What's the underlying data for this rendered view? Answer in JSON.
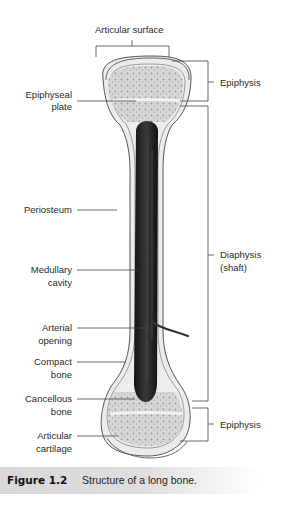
{
  "figure": {
    "number": "Figure 1.2",
    "caption": "Structure of a long bone."
  },
  "labels": {
    "articular_surface": "Articular surface",
    "epiphysis_top": "Epiphysis",
    "epiphyseal_plate_1": "Epiphyseal",
    "epiphyseal_plate_2": "plate",
    "periosteum": "Periosteum",
    "diaphysis_1": "Diaphysis",
    "diaphysis_2": "(shaft)",
    "medullary_1": "Medullary",
    "medullary_2": "cavity",
    "arterial_1": "Arterial",
    "arterial_2": "opening",
    "compact_1": "Compact",
    "compact_2": "bone",
    "cancellous_1": "Cancellous",
    "cancellous_2": "bone",
    "epiphysis_bottom": "Epiphysis",
    "articular_cart_1": "Articular",
    "articular_cart_2": "cartilage"
  },
  "colors": {
    "caption_bg": "#d8d8d8",
    "marrow": "#1a1a1a",
    "spongy": "#cfcfcf"
  }
}
